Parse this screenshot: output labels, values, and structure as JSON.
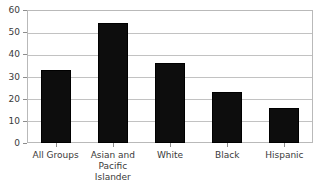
{
  "chart_data": {
    "type": "bar",
    "title": "",
    "subtitle": "",
    "xlabel": "",
    "ylabel": "",
    "categories": [
      "All Groups",
      "Asian and Pacific Islander",
      "White",
      "Black",
      "Hispanic"
    ],
    "category_lines": [
      [
        "All Groups",
        ""
      ],
      [
        "Asian and",
        "Pacific Islander"
      ],
      [
        "White",
        ""
      ],
      [
        "Black",
        ""
      ],
      [
        "Hispanic",
        ""
      ]
    ],
    "values": [
      33,
      54,
      36,
      23,
      16
    ],
    "ylim": [
      0,
      60
    ],
    "yticks": [
      0,
      10,
      20,
      30,
      40,
      50,
      60
    ],
    "ytick_labels": [
      "0",
      "10",
      "20",
      "30",
      "40",
      "50",
      "60"
    ],
    "grid": true,
    "grid_axis": "y",
    "legend": false,
    "legend_position": "none",
    "bar_color": "#0d0d0d",
    "grid_color": "#c2c2c2",
    "frame_color": "#b9b9b9",
    "text_color": "#3a3a3a"
  },
  "caption": {
    "clipped_text": ""
  }
}
